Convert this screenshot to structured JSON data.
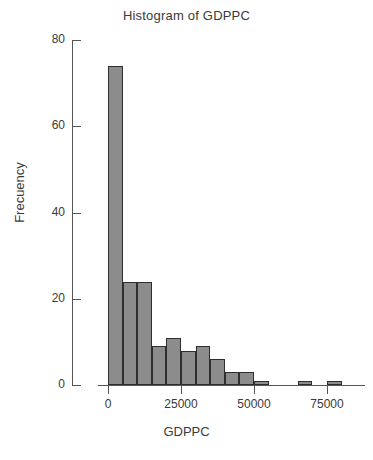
{
  "chart_data": {
    "type": "bar",
    "title": "Histogram of GDPPC",
    "xlabel": "GDPPC",
    "ylabel": "Frecuency",
    "grid": false,
    "legend": false,
    "xlim": [
      -2000,
      88000
    ],
    "ylim": [
      0,
      80
    ],
    "bin_width": 5000,
    "xticks": [
      0,
      25000,
      50000,
      75000
    ],
    "xtick_labels": [
      "0",
      "25000",
      "50000",
      "75000"
    ],
    "yticks": [
      0,
      20,
      40,
      60,
      80
    ],
    "ytick_labels": [
      "0",
      "20",
      "40",
      "60",
      "80"
    ],
    "bar_color": "#8c8c8c",
    "bar_edge_color": "#2e2e2e",
    "bins": [
      {
        "x0": 0,
        "x1": 5000,
        "value": 74
      },
      {
        "x0": 5000,
        "x1": 10000,
        "value": 24
      },
      {
        "x0": 10000,
        "x1": 15000,
        "value": 24
      },
      {
        "x0": 15000,
        "x1": 20000,
        "value": 9
      },
      {
        "x0": 20000,
        "x1": 25000,
        "value": 11
      },
      {
        "x0": 25000,
        "x1": 30000,
        "value": 8
      },
      {
        "x0": 30000,
        "x1": 35000,
        "value": 9
      },
      {
        "x0": 35000,
        "x1": 40000,
        "value": 6
      },
      {
        "x0": 40000,
        "x1": 45000,
        "value": 3
      },
      {
        "x0": 45000,
        "x1": 50000,
        "value": 3
      },
      {
        "x0": 50000,
        "x1": 55000,
        "value": 1
      },
      {
        "x0": 55000,
        "x1": 60000,
        "value": 0
      },
      {
        "x0": 60000,
        "x1": 65000,
        "value": 0
      },
      {
        "x0": 65000,
        "x1": 70000,
        "value": 1
      },
      {
        "x0": 70000,
        "x1": 75000,
        "value": 0
      },
      {
        "x0": 75000,
        "x1": 80000,
        "value": 1
      }
    ]
  }
}
